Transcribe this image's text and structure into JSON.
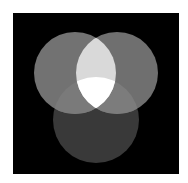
{
  "diagram": {
    "type": "venn",
    "sets": 3,
    "background": {
      "x": 13,
      "y": 13,
      "width": 166,
      "height": 161,
      "color": "#000000"
    },
    "circles": [
      {
        "id": "top-left",
        "cx": 75,
        "cy": 73,
        "r": 41,
        "color": "#727272"
      },
      {
        "id": "top-right",
        "cx": 117,
        "cy": 73,
        "r": 41,
        "color": "#6f6f6f"
      },
      {
        "id": "bottom",
        "cx": 96,
        "cy": 120,
        "r": 43,
        "color": "#393939"
      }
    ],
    "regions": {
      "top_left_top_right": "#d9d9d9",
      "top_left_bottom": "#7a7a7a",
      "top_right_bottom": "#7c7c7c",
      "all_three": "#ffffff"
    }
  }
}
